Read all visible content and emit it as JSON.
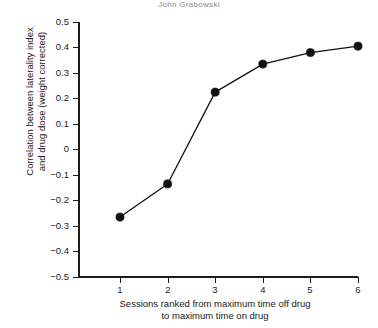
{
  "header": {
    "fragment_text": "John Grabowski"
  },
  "chart_data": {
    "type": "line",
    "title": "",
    "subtitle": "",
    "xlabel": "Sessions ranked from maximum time off drug\nto maximum time on drug",
    "ylabel": "Correlation between laterality index\nand drug dose (weight corrected)",
    "x": [
      1,
      2,
      3,
      4,
      5,
      6
    ],
    "categories": [
      "1",
      "2",
      "3",
      "4",
      "5",
      "6"
    ],
    "values": [
      -0.265,
      -0.135,
      0.225,
      0.335,
      0.38,
      0.405
    ],
    "series": [
      {
        "name": "Correlation",
        "values": [
          -0.265,
          -0.135,
          0.225,
          0.335,
          0.38,
          0.405
        ]
      }
    ],
    "xlim": [
      0.5,
      6.2
    ],
    "ylim": [
      -0.5,
      0.5
    ],
    "xticks": [
      1,
      2,
      3,
      4,
      5,
      6
    ],
    "xtick_labels": [
      "1",
      "2",
      "3",
      "4",
      "5",
      "6"
    ],
    "yticks": [
      0.5,
      0.4,
      0.3,
      0.2,
      0.1,
      0,
      -0.1,
      -0.2,
      -0.3,
      -0.4,
      -0.5
    ],
    "ytick_labels": [
      "0.5",
      "0.4",
      "0.3",
      "0.2",
      "0.1",
      "0",
      "−0.1",
      "−0.2",
      "−0.3",
      "−0.4",
      "−0.5"
    ],
    "grid": false,
    "legend": false,
    "legend_position": "none",
    "marker": "filled-circle",
    "line_color": "#111111",
    "marker_color": "#111111",
    "background_color": "#ffffff",
    "axis_color": "#1c1c1c"
  }
}
